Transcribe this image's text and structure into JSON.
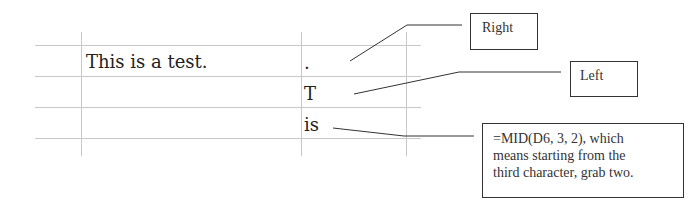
{
  "spreadsheet": {
    "cells": {
      "source_text": "This is a test.",
      "right_result": ".",
      "left_result": "T",
      "mid_result": "is"
    }
  },
  "callouts": {
    "right": {
      "label": "Right"
    },
    "left": {
      "label": "Left"
    },
    "mid": {
      "lines": [
        "=MID(D6, 3, 2), which",
        "means starting from the",
        "third character, grab two."
      ]
    }
  },
  "colors": {
    "grid": "#c8c8c8",
    "leader": "#333333",
    "text": "#222222"
  }
}
